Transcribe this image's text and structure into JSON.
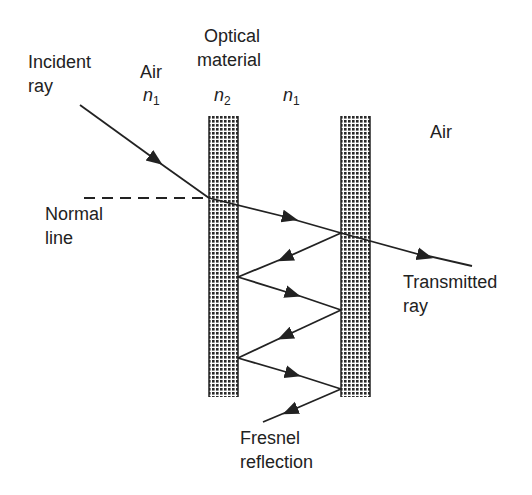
{
  "labels": {
    "incident": [
      "Incident",
      "ray"
    ],
    "air_left": "Air",
    "n1_left": "n",
    "n1_left_sub": "1",
    "optical": [
      "Optical",
      "material"
    ],
    "n2": "n",
    "n2_sub": "2",
    "n1_right": "n",
    "n1_right_sub": "1",
    "air_right": "Air",
    "normal": [
      "Normal",
      "line"
    ],
    "transmitted": [
      "Transmitted",
      "ray"
    ],
    "fresnel": [
      "Fresnel",
      "reflection"
    ]
  },
  "colors": {
    "ink": "#222222",
    "slab": "#333333"
  }
}
